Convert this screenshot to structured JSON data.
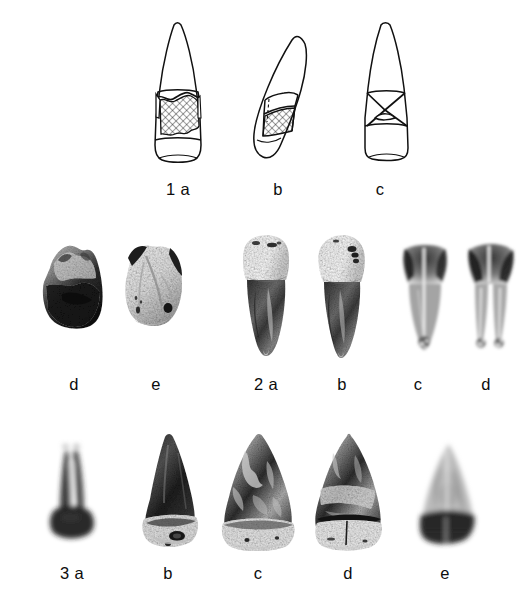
{
  "figure": {
    "background_color": "#ffffff",
    "ink_color": "#111111",
    "width": 530,
    "height": 605,
    "kind": "composite photographic and line-drawing plate of teeth"
  },
  "rows": [
    {
      "id": "row-1",
      "description": "line drawings of a tooth crown and root in three views with hatched wear facet",
      "items": [
        {
          "id": "1a",
          "label": "1 a",
          "type": "line-drawing",
          "view": "labial",
          "label_x": 178,
          "label_y": 190
        },
        {
          "id": "1b",
          "label": "b",
          "type": "line-drawing",
          "view": "mesial",
          "label_x": 278,
          "label_y": 190
        },
        {
          "id": "1c",
          "label": "c",
          "type": "line-drawing",
          "view": "lingual",
          "label_x": 380,
          "label_y": 190
        }
      ]
    },
    {
      "id": "row-2",
      "description": "photographs of tooth fragments and whole teeth, plus radiographs",
      "items": [
        {
          "id": "2d-frag",
          "label": "d",
          "type": "photograph",
          "label_x": 73,
          "label_y": 385
        },
        {
          "id": "2e-frag",
          "label": "e",
          "type": "photograph",
          "label_x": 155,
          "label_y": 385
        },
        {
          "id": "2a",
          "label": "2 a",
          "type": "photograph",
          "label_x": 262,
          "label_y": 385
        },
        {
          "id": "2b",
          "label": "b",
          "type": "photograph",
          "label_x": 339,
          "label_y": 385
        },
        {
          "id": "2c",
          "label": "c",
          "type": "radiograph",
          "label_x": 416,
          "label_y": 385
        },
        {
          "id": "2dx",
          "label": "d",
          "type": "radiograph",
          "label_x": 484,
          "label_y": 385
        }
      ]
    },
    {
      "id": "row-3",
      "description": "radiograph and photographs of worn tooth crowns",
      "items": [
        {
          "id": "3a",
          "label": "3 a",
          "type": "radiograph",
          "label_x": 70,
          "label_y": 567
        },
        {
          "id": "3b",
          "label": "b",
          "type": "photograph",
          "label_x": 168,
          "label_y": 567
        },
        {
          "id": "3c",
          "label": "c",
          "type": "photograph",
          "label_x": 258,
          "label_y": 567
        },
        {
          "id": "3d",
          "label": "d",
          "type": "photograph",
          "label_x": 348,
          "label_y": 567
        },
        {
          "id": "3e",
          "label": "e",
          "type": "radiograph",
          "label_x": 445,
          "label_y": 567
        }
      ]
    }
  ]
}
